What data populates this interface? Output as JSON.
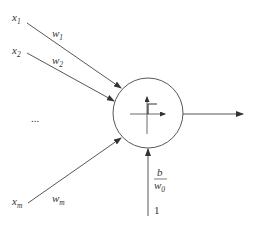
{
  "diagram": {
    "type": "perceptron",
    "colors": {
      "stroke": "#444444",
      "text": "#333333",
      "background": "#ffffff"
    },
    "inputs": [
      {
        "label": "x",
        "subscript": "1",
        "weight": "w",
        "weight_subscript": "1"
      },
      {
        "label": "x",
        "subscript": "2",
        "weight": "w",
        "weight_subscript": "2"
      },
      {
        "label": "x",
        "subscript": "m",
        "weight": "w",
        "weight_subscript": "m"
      }
    ],
    "ellipsis": "...",
    "neuron": {
      "activation": "step-function"
    },
    "bias": {
      "numerator": "b",
      "denominator": "w",
      "denominator_subscript": "0",
      "input_value": "1"
    }
  }
}
